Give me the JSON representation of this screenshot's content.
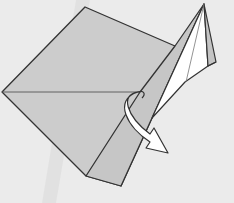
{
  "diagram": {
    "type": "origami-fold-step",
    "background_color": "#ebebeb",
    "band_color": "#dedede",
    "paper_color": "#cccccc",
    "flap_white": "#ffffff",
    "flap_shadow": "#c4c4c4",
    "line_color": "#333333",
    "arrow": {
      "kind": "fold-behind",
      "direction": "down-right",
      "fill": "#ffffff"
    }
  }
}
